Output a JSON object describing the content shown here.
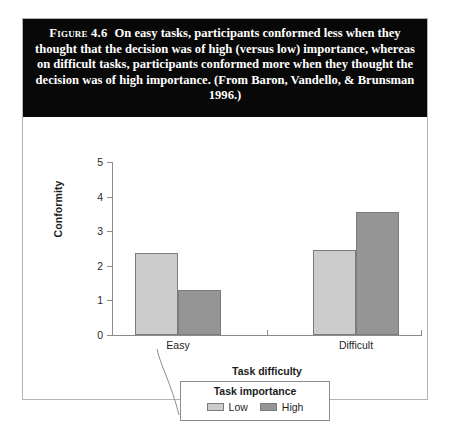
{
  "figure": {
    "label": "Figure 4.6",
    "caption": "On easy tasks, participants conformed less when they thought that the decision was of high (versus low) importance, whereas on difficult tasks, participants conformed more when they thought the decision was of high importance. (From Baron, Vandello, & Brunsman 1996.)"
  },
  "colors": {
    "band_background": "#080808",
    "band_text": "#ffffff",
    "low_fill": "#cccccc",
    "high_fill": "#959595",
    "bar_border": "#7b7b7b",
    "axis": "#8c8c8c",
    "frame": "#b4b4b4"
  },
  "chart_data": {
    "type": "bar",
    "title": "",
    "xlabel": "Task difficulty",
    "ylabel": "Conformity",
    "categories": [
      "Easy",
      "Difficult"
    ],
    "series": [
      {
        "name": "Low",
        "values": [
          2.37,
          2.46
        ]
      },
      {
        "name": "High",
        "values": [
          1.3,
          3.55
        ]
      }
    ],
    "ylim": [
      0,
      5
    ],
    "yticks": [
      5,
      4,
      3,
      2,
      1,
      0
    ],
    "ytick_labels": [
      "5",
      "4",
      "3",
      "2",
      "1",
      "0"
    ],
    "grid": false,
    "legend": {
      "title": "Task importance",
      "position": "below-axis",
      "entries": [
        "Low",
        "High"
      ]
    }
  }
}
